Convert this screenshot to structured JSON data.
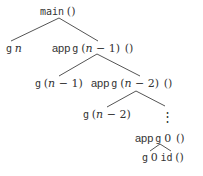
{
  "diagram": {
    "type": "call-tree",
    "colors": {
      "text": "#333333",
      "edge": "#555555",
      "background": "#ffffff"
    },
    "nodes": [
      {
        "id": "root",
        "fn": "main",
        "args": "()"
      },
      {
        "id": "gn",
        "fn": "g",
        "args": "n"
      },
      {
        "id": "app1",
        "prefix": "app",
        "fn": "g",
        "args": "(n − 1)",
        "extra": "()"
      },
      {
        "id": "gn1",
        "fn": "g",
        "args": "(n − 1)"
      },
      {
        "id": "app2",
        "prefix": "app",
        "fn": "g",
        "args": "(n − 2)",
        "extra": "()"
      },
      {
        "id": "gn2",
        "fn": "g",
        "args": "(n − 2)"
      },
      {
        "id": "ellipsis",
        "label": "⋮"
      },
      {
        "id": "app0",
        "prefix": "app",
        "fn": "g",
        "args": "0",
        "extra": "()"
      },
      {
        "id": "g0",
        "fn": "g",
        "args": "0",
        "extra1": "id",
        "extra2": "()"
      }
    ],
    "edges": [
      [
        "root",
        "gn"
      ],
      [
        "root",
        "app1"
      ],
      [
        "app1",
        "gn1"
      ],
      [
        "app1",
        "app2"
      ],
      [
        "app2",
        "gn2"
      ],
      [
        "app2",
        "ellipsis"
      ],
      [
        "app0",
        "g0"
      ]
    ],
    "text": {
      "main": "main",
      "unit": "()",
      "g": "g",
      "n": "n",
      "app": "app",
      "lp": "(",
      "rp": ")",
      "minus": " − ",
      "one": "1",
      "two": "2",
      "zero": "0",
      "id": "id",
      "vdots": "⋮"
    }
  }
}
